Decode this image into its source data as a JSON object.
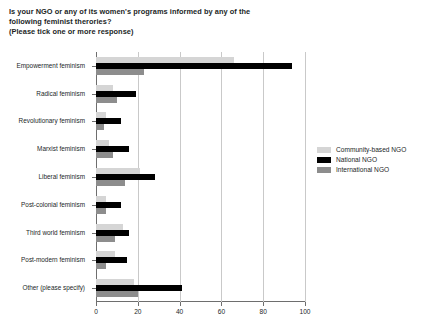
{
  "title": {
    "line1": "Is your NGO or any of its women's programs informed by any of the",
    "line2": "following feminist therories?",
    "line3": "(Please tick one or more response)"
  },
  "legend": {
    "position": "right",
    "items": [
      {
        "label": "Community-based NGO",
        "color": "#d5d5d5"
      },
      {
        "label": "National NGO",
        "color": "#000000"
      },
      {
        "label": "International NGO",
        "color": "#8d8d8d"
      }
    ]
  },
  "axis": {
    "x_ticks": [
      "0",
      "20",
      "40",
      "60",
      "80",
      "100"
    ],
    "y_labels": [
      "Empowerment feminism",
      "Radical feminism",
      "Revolutionary feminism",
      "Marxist feminism",
      "Liberal feminism",
      "Post-colonial feminism",
      "Third world feminism",
      "Post-modern feminism",
      "Other (please specify)"
    ]
  },
  "chart_data": {
    "type": "bar",
    "orientation": "horizontal",
    "title": "Is your NGO or any of its women's programs informed by any of the following feminist therories? (Please tick one or more response)",
    "xlabel": "",
    "ylabel": "",
    "xlim": [
      0,
      100
    ],
    "xticks": [
      0,
      20,
      40,
      60,
      80,
      100
    ],
    "grid": "vertical",
    "legend_position": "right",
    "categories": [
      "Empowerment feminism",
      "Radical feminism",
      "Revolutionary feminism",
      "Marxist feminism",
      "Liberal feminism",
      "Post-colonial feminism",
      "Third world feminism",
      "Post-modern feminism",
      "Other (please specify)"
    ],
    "series": [
      {
        "name": "Community-based NGO",
        "color": "#d5d5d5",
        "values": [
          66,
          8,
          5,
          6,
          21,
          5,
          13,
          9,
          18
        ]
      },
      {
        "name": "National NGO",
        "color": "#000000",
        "values": [
          94,
          19,
          12,
          16,
          28,
          12,
          16,
          15,
          41
        ]
      },
      {
        "name": "International NGO",
        "color": "#8d8d8d",
        "values": [
          23,
          10,
          4,
          8,
          14,
          5,
          9,
          5,
          20
        ]
      }
    ]
  }
}
